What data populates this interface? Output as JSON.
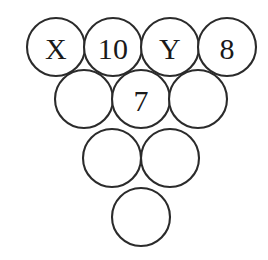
{
  "figure": {
    "name": "circle-pyramid-puzzle",
    "type": "diagram",
    "background_color": "#ffffff",
    "stroke_color": "#2b2b2b",
    "label_color": "#1a1a1a",
    "circle_radius": 29,
    "circle_diameter": 58,
    "horizontal_spacing": 57,
    "vertical_spacing": 52
  },
  "rows": [
    {
      "index": 0,
      "count": 4,
      "cy": 47,
      "circles": [
        {
          "id": "r1c1",
          "cx": 56,
          "cy": 47,
          "label": "X"
        },
        {
          "id": "r1c2",
          "cx": 113,
          "cy": 47,
          "label": "10"
        },
        {
          "id": "r1c3",
          "cx": 170,
          "cy": 47,
          "label": "Y"
        },
        {
          "id": "r1c4",
          "cx": 227,
          "cy": 47,
          "label": "8"
        }
      ]
    },
    {
      "index": 1,
      "count": 3,
      "cy": 99,
      "circles": [
        {
          "id": "r2c1",
          "cx": 84,
          "cy": 99,
          "label": ""
        },
        {
          "id": "r2c2",
          "cx": 141,
          "cy": 99,
          "label": "7"
        },
        {
          "id": "r2c3",
          "cx": 198,
          "cy": 99,
          "label": ""
        }
      ]
    },
    {
      "index": 2,
      "count": 2,
      "cy": 158,
      "circles": [
        {
          "id": "r3c1",
          "cx": 112,
          "cy": 158,
          "label": ""
        },
        {
          "id": "r3c2",
          "cx": 170,
          "cy": 158,
          "label": ""
        }
      ]
    },
    {
      "index": 3,
      "count": 1,
      "cy": 217,
      "circles": [
        {
          "id": "r4c1",
          "cx": 141,
          "cy": 217,
          "label": ""
        }
      ]
    }
  ],
  "labels": {
    "r1c1": "X",
    "r1c2": "10",
    "r1c3": "Y",
    "r1c4": "8",
    "r2c2": "7"
  }
}
